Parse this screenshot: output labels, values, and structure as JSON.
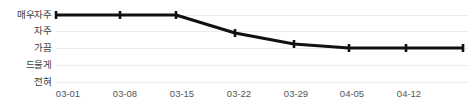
{
  "chart_data": {
    "type": "line",
    "title": "",
    "xlabel": "",
    "ylabel": "",
    "grid": true,
    "legend": "none",
    "line_color": "#111111",
    "grid_color": "#ececec",
    "tick_label_color": "#555555",
    "y_categories": [
      "매우자주",
      "자주",
      "가끔",
      "드물게",
      "전혀"
    ],
    "y_levels_top_to_bottom": [
      "매우자주",
      "자주",
      "가끔",
      "드물게",
      "전혀"
    ],
    "x_tick_labels": [
      "03-01",
      "03-08",
      "03-15",
      "03-22",
      "03-29",
      "04-05",
      "04-12"
    ],
    "x": [
      "03-01",
      "03-08",
      "03-15",
      "03-22",
      "03-29",
      "04-05",
      "04-12",
      "04-19"
    ],
    "values_label": [
      "매우자주",
      "매우자주",
      "매우자주",
      "자주",
      "가끔",
      "가끔",
      "가끔",
      "가끔"
    ],
    "values_numeric": [
      5,
      5,
      5,
      3.85,
      3,
      3,
      3,
      3
    ],
    "ylim": [
      1,
      5
    ],
    "series": [
      {
        "name": "빈도",
        "values": [
          5,
          5,
          5,
          3.85,
          3,
          3,
          3,
          3
        ]
      }
    ],
    "points_px": [
      {
        "x": 56,
        "y": 15
      },
      {
        "x": 120,
        "y": 15
      },
      {
        "x": 176,
        "y": 15
      },
      {
        "x": 235,
        "y": 33
      },
      {
        "x": 294,
        "y": 44
      },
      {
        "x": 349,
        "y": 48
      },
      {
        "x": 406,
        "y": 48
      },
      {
        "x": 463,
        "y": 48
      }
    ],
    "gridlines_px": [
      15,
      31,
      48,
      65,
      82
    ],
    "x_ticks_px": [
      68,
      125,
      182,
      239,
      296,
      352,
      409
    ]
  },
  "y_axis": {
    "labels": [
      {
        "text": "매우자주",
        "top": 10
      },
      {
        "text": "자주",
        "top": 26
      },
      {
        "text": "가끔",
        "top": 43
      },
      {
        "text": "드물게",
        "top": 60
      },
      {
        "text": "전혀",
        "top": 77
      }
    ]
  },
  "x_axis": {
    "labels": [
      {
        "text": "03-01",
        "left": 68
      },
      {
        "text": "03-08",
        "left": 125
      },
      {
        "text": "03-15",
        "left": 182
      },
      {
        "text": "03-22",
        "left": 239
      },
      {
        "text": "03-29",
        "left": 296
      },
      {
        "text": "04-05",
        "left": 352
      },
      {
        "text": "04-12",
        "left": 409
      }
    ]
  }
}
